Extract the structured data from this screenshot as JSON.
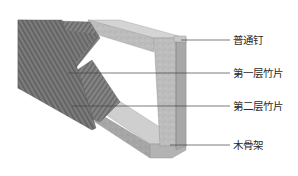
{
  "diagram": {
    "type": "structural-illustration",
    "colors": {
      "bamboo_dark": "#7a7a7a",
      "bamboo_stripe": "#5e5e5e",
      "frame_light": "#c4c4c4",
      "frame_mid": "#a9a9a9",
      "frame_shadow": "#8f8f8f",
      "leader_line": "#444444"
    },
    "labels": [
      {
        "id": "nail",
        "text": "普通钉"
      },
      {
        "id": "layer1",
        "text": "第一层竹片"
      },
      {
        "id": "layer2",
        "text": "第二层竹片"
      },
      {
        "id": "frame",
        "text": "木骨架"
      }
    ]
  }
}
